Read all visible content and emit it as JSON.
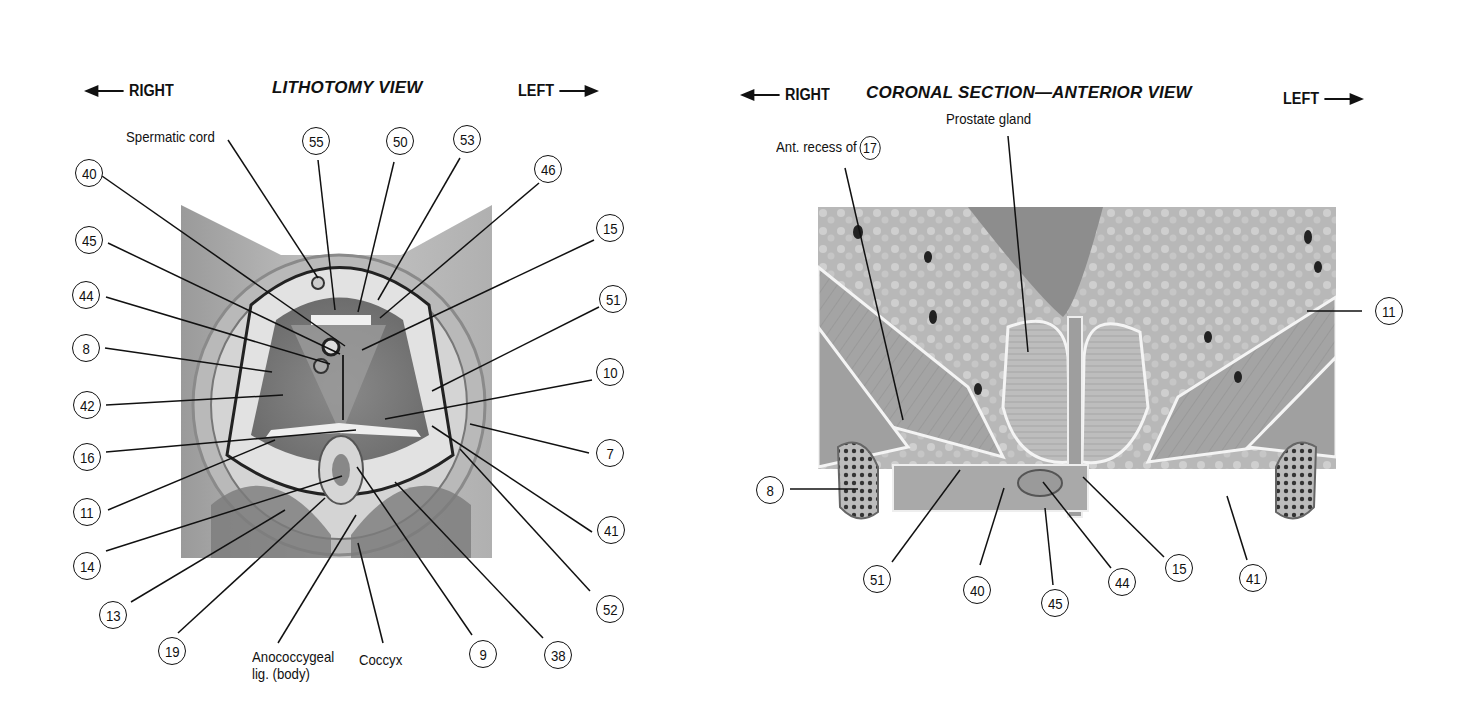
{
  "left_figure": {
    "title": "LITHOTOMY VIEW",
    "direction_right": "RIGHT",
    "direction_left": "LEFT",
    "text_labels": {
      "spermatic_cord": "Spermatic cord",
      "anococcygeal_line1": "Anococcygeal",
      "anococcygeal_line2": "lig. (body)",
      "coccyx": "Coccyx"
    },
    "callouts": [
      "40",
      "45",
      "44",
      "8",
      "42",
      "16",
      "11",
      "14",
      "13",
      "19",
      "55",
      "50",
      "53",
      "46",
      "15",
      "51",
      "10",
      "7",
      "41",
      "52",
      "38",
      "9"
    ]
  },
  "right_figure": {
    "title": "CORONAL SECTION—ANTERIOR VIEW",
    "direction_right": "RIGHT",
    "direction_left": "LEFT",
    "text_labels": {
      "ant_recess": "Ant. recess of",
      "ant_recess_num": "17",
      "prostate": "Prostate gland"
    },
    "callouts": [
      "11",
      "8",
      "51",
      "40",
      "45",
      "44",
      "15",
      "41"
    ]
  },
  "colors": {
    "ink": "#111111",
    "tissue_light": "#c8c8c8",
    "tissue_mid": "#a9a9a9",
    "tissue_dark": "#6e6e6e",
    "background": "#ffffff"
  }
}
